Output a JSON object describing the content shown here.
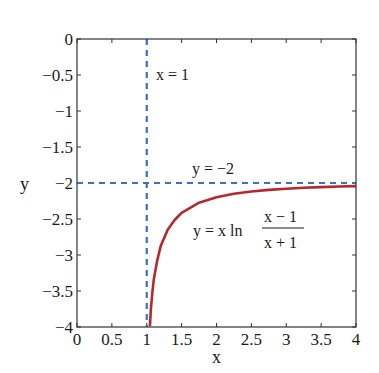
{
  "chart_data": {
    "type": "line",
    "title": "",
    "xlabel": "x",
    "ylabel": "y",
    "xlim": [
      0,
      4
    ],
    "ylim": [
      -4,
      0
    ],
    "grid": false,
    "x_ticks": [
      "0",
      "0.5",
      "1",
      "1.5",
      "2",
      "2.5",
      "3",
      "3.5",
      "4"
    ],
    "y_ticks": [
      "0",
      "−0.5",
      "−1",
      "−1.5",
      "−2",
      "−2.5",
      "−3",
      "−3.5",
      "−4"
    ],
    "x_tick_values": [
      0,
      0.5,
      1,
      1.5,
      2,
      2.5,
      3,
      3.5,
      4
    ],
    "y_tick_values": [
      0,
      -0.5,
      -1,
      -1.5,
      -2,
      -2.5,
      -3,
      -3.5,
      -4
    ],
    "series": [
      {
        "name": "y = x ln((x − 1)/(x + 1))",
        "color": "#b5282e",
        "style": "solid",
        "x": [
          1.045,
          1.06,
          1.08,
          1.1,
          1.15,
          1.2,
          1.3,
          1.4,
          1.5,
          1.75,
          2,
          2.25,
          2.5,
          2.75,
          3,
          3.25,
          3.5,
          3.75,
          4
        ],
        "y": [
          -3.99,
          -3.748,
          -3.53,
          -3.349,
          -3.077,
          -2.877,
          -2.648,
          -2.514,
          -2.414,
          -2.274,
          -2.197,
          -2.148,
          -2.118,
          -2.096,
          -2.079,
          -2.066,
          -2.057,
          -2.049,
          -2.043
        ]
      },
      {
        "name": "x = 1",
        "color": "#3a6fc4",
        "style": "dashed",
        "x": [
          1,
          1
        ],
        "y": [
          0,
          -4
        ]
      },
      {
        "name": "y = −2",
        "color": "#3a6fc4",
        "style": "dashed",
        "x": [
          0,
          4
        ],
        "y": [
          -2,
          -2
        ]
      }
    ],
    "annotations": [
      {
        "text": "x = 1",
        "x": 1.15,
        "y": -0.55
      },
      {
        "text": "y = −2",
        "x": 1.65,
        "y": -1.8
      },
      {
        "text_main": "y = x ln",
        "numerator": "x − 1",
        "denominator": "x + 1",
        "x": 1.65,
        "y": -2.65
      }
    ]
  },
  "labels": {
    "xlabel": "x",
    "ylabel": "y",
    "annot_vertical": "x = 1",
    "annot_horizontal": "y = −2",
    "formula_main": "y = x ln",
    "formula_num": "x − 1",
    "formula_den": "x + 1"
  },
  "colors": {
    "curve": "#b5282e",
    "asymptote": "#3a6fc4",
    "axis": "#333333"
  }
}
